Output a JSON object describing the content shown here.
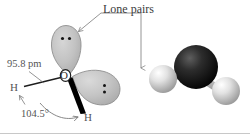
{
  "figure": {
    "annotations": {
      "lone_pairs_label": "Lone pairs",
      "bond_length_label": "95.8 pm",
      "bond_angle_label": "104.5°"
    },
    "atoms": {
      "oxygen_label": "O",
      "hydrogen_left_label": "H",
      "hydrogen_right_label": "H"
    },
    "colors": {
      "lobe_fill": "#bdbdbd",
      "lobe_stroke": "#8a8a8a",
      "wedge": "#000000",
      "leader_line": "#7a7a7a",
      "text": "#4a4a4a",
      "oxygen_ball": "#1a1a1a",
      "hydrogen_ball": "#e8e8e8",
      "bond_stick": "#b5b5b5",
      "border": "#c8c8c8"
    },
    "lone_pair_dots": {
      "upper_lobe_count": 2,
      "right_lobe_count": 2
    },
    "ball_stick": {
      "oxygen_name": "oxygen-atom",
      "hydrogen_left_name": "hydrogen-atom-left",
      "hydrogen_right_name": "hydrogen-atom-right"
    }
  }
}
